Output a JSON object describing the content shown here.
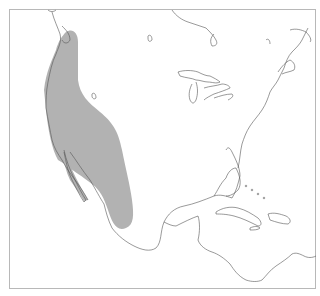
{
  "map": {
    "region": "North America, Central America and Caribbean",
    "range_label": "species-range",
    "colors": {
      "range_fill": "#b2b2b2",
      "coastline": "#555555",
      "frame": "#b8b8b8",
      "background": "#ffffff"
    }
  }
}
